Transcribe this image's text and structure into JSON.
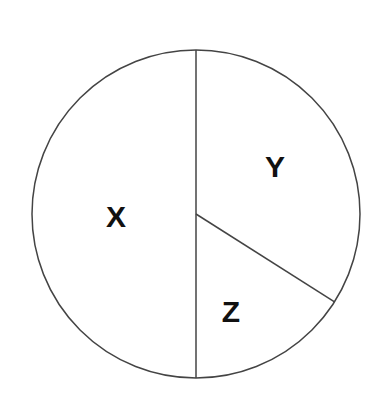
{
  "chart_data": {
    "type": "pie",
    "title": "",
    "categories": [
      "X",
      "Y",
      "Z"
    ],
    "values": [
      50,
      34,
      16
    ],
    "unit": "percent (estimated from angles; no numeric labels shown)",
    "start_angle": "12 o'clock",
    "direction": "clockwise, order Y then Z then X",
    "legend": "none (labels inside slices)",
    "colors": {
      "fill": "#ffffff",
      "stroke": "#444444",
      "label": "#111111"
    }
  },
  "labels": {
    "x": "X",
    "y": "Y",
    "z": "Z"
  }
}
